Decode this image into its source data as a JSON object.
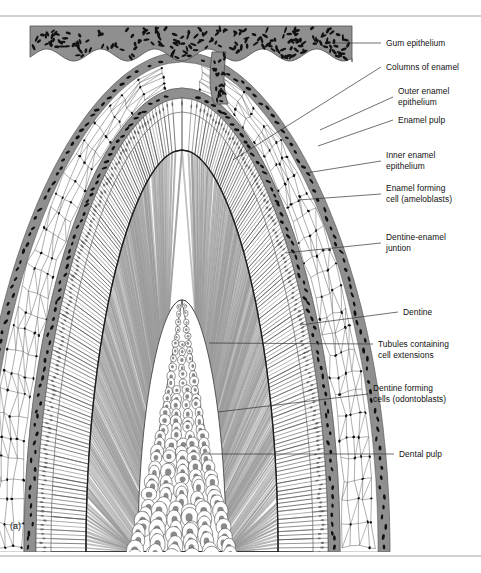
{
  "figure": {
    "panel_letter": "(a)",
    "colors": {
      "epithelium_fill": "#8f8f8f",
      "nucleus": "#111111",
      "dentine_stripe": "#9a9a9a",
      "enamel_line": "#5b5b5b",
      "rule": "#9a9a9a",
      "leader": "#333333",
      "background": "#ffffff"
    },
    "rules": [
      {
        "name": "top-rule",
        "y": 16
      },
      {
        "name": "bottom-rule",
        "y": 556
      }
    ],
    "labels": [
      {
        "id": "gum-epithelium",
        "text": "Gum epithelium",
        "x": 386,
        "y": 38,
        "leader": {
          "x1": 332,
          "y1": 43,
          "x2": 381,
          "y2": 43
        }
      },
      {
        "id": "columns-of-enamel",
        "text": "Columns of enamel",
        "x": 386,
        "y": 62,
        "leader": {
          "x1": 233,
          "y1": 160,
          "x2": 381,
          "y2": 67
        }
      },
      {
        "id": "outer-enamel-epithelium",
        "text": "Outer enamel\nepithelium",
        "x": 398,
        "y": 86,
        "leader": {
          "x1": 320,
          "y1": 130,
          "x2": 393,
          "y2": 97
        }
      },
      {
        "id": "enamel-pulp",
        "text": "Enamel pulp",
        "x": 398,
        "y": 115,
        "leader": {
          "x1": 318,
          "y1": 146,
          "x2": 393,
          "y2": 120
        }
      },
      {
        "id": "inner-enamel-epithelium",
        "text": "Inner enamel\nepithelium",
        "x": 386,
        "y": 150,
        "leader": {
          "x1": 306,
          "y1": 173,
          "x2": 381,
          "y2": 161
        }
      },
      {
        "id": "enamel-forming-cell",
        "text": "Enamel forming\ncell (ameloblasts)",
        "x": 386,
        "y": 183,
        "leader": {
          "x1": 298,
          "y1": 200,
          "x2": 381,
          "y2": 194
        }
      },
      {
        "id": "dentine-enamel-junction",
        "text": "Dentine-enamel\njuntion",
        "x": 386,
        "y": 232,
        "leader": {
          "x1": 285,
          "y1": 253,
          "x2": 381,
          "y2": 243
        }
      },
      {
        "id": "dentine",
        "text": "Dentine",
        "x": 403,
        "y": 307,
        "leader": {
          "x1": 300,
          "y1": 325,
          "x2": 398,
          "y2": 312
        }
      },
      {
        "id": "tubules-containing-cell-extensions",
        "text": "Tubules containing\ncell extensions",
        "x": 378,
        "y": 339,
        "leader": {
          "x1": 209,
          "y1": 343,
          "x2": 373,
          "y2": 344
        }
      },
      {
        "id": "dentine-forming-cells",
        "text": "Dentine forming\ncells (odontoblasts)",
        "x": 373,
        "y": 383,
        "leader": {
          "x1": 218,
          "y1": 412,
          "x2": 368,
          "y2": 394
        }
      },
      {
        "id": "dental-pulp",
        "text": "Dental pulp",
        "x": 399,
        "y": 449,
        "leader": {
          "x1": 202,
          "y1": 454,
          "x2": 394,
          "y2": 454
        }
      }
    ],
    "structures": [
      {
        "id": "gum-epithelium-band",
        "label": "Gum epithelium"
      },
      {
        "id": "epithelial-stalk",
        "label": "Epithelial stalk"
      },
      {
        "id": "outer-enamel-epithelium-band",
        "label": "Outer enamel epithelium"
      },
      {
        "id": "enamel-pulp-reticulum",
        "label": "Enamel pulp"
      },
      {
        "id": "inner-enamel-epithelium-band",
        "label": "Inner enamel epithelium"
      },
      {
        "id": "ameloblast-palisade",
        "label": "Enamel forming cell (ameloblasts)"
      },
      {
        "id": "enamel-columns-zone",
        "label": "Columns of enamel"
      },
      {
        "id": "dentine-enamel-junction-line",
        "label": "Dentine-enamel juntion"
      },
      {
        "id": "dentine-zone",
        "label": "Dentine"
      },
      {
        "id": "dentine-tubules",
        "label": "Tubules containing cell extensions"
      },
      {
        "id": "odontoblast-core",
        "label": "Dentine forming cells (odontoblasts)"
      },
      {
        "id": "dental-pulp-core",
        "label": "Dental pulp"
      }
    ]
  }
}
